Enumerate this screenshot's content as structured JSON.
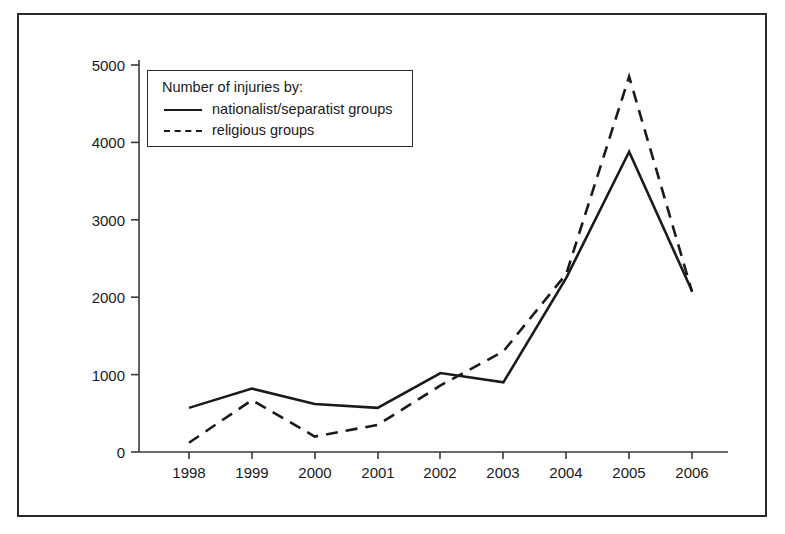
{
  "chart_data": {
    "type": "line",
    "title": "",
    "subtitle": "",
    "xlabel": "",
    "ylabel": "",
    "categories": [
      "1998",
      "1999",
      "2000",
      "2001",
      "2002",
      "2003",
      "2004",
      "2005",
      "2006"
    ],
    "x": [
      1998,
      1999,
      2000,
      2001,
      2002,
      2003,
      2004,
      2005,
      2006
    ],
    "series": [
      {
        "name": "nationalist/separatist groups",
        "style": "solid",
        "color": "#1a1a1a",
        "values": [
          570,
          820,
          620,
          570,
          1020,
          900,
          2250,
          3880,
          2080
        ]
      },
      {
        "name": "religious groups",
        "style": "dashed",
        "color": "#1a1a1a",
        "values": [
          120,
          670,
          200,
          350,
          860,
          1300,
          2300,
          4850,
          2070
        ]
      }
    ],
    "ylim": [
      0,
      5000
    ],
    "yticks": [
      0,
      1000,
      2000,
      3000,
      4000,
      5000
    ],
    "ytick_labels": [
      "0",
      "1000",
      "2000",
      "3000",
      "4000",
      "5000"
    ],
    "xtick_labels": [
      "1998",
      "1999",
      "2000",
      "2001",
      "2002",
      "2003",
      "2004",
      "2005",
      "2006"
    ],
    "grid": false,
    "legend_position": "upper-left"
  },
  "legend": {
    "title": "Number of injuries by:",
    "entries": [
      {
        "label": "nationalist/separatist groups",
        "style": "solid"
      },
      {
        "label": "religious groups",
        "style": "dashed"
      }
    ]
  },
  "axes": {
    "y_tick_labels": [
      "5000",
      "4000",
      "3000",
      "2000",
      "1000",
      "0"
    ],
    "x_tick_labels": [
      "1998",
      "1999",
      "2000",
      "2001",
      "2002",
      "2003",
      "2004",
      "2005",
      "2006"
    ]
  }
}
